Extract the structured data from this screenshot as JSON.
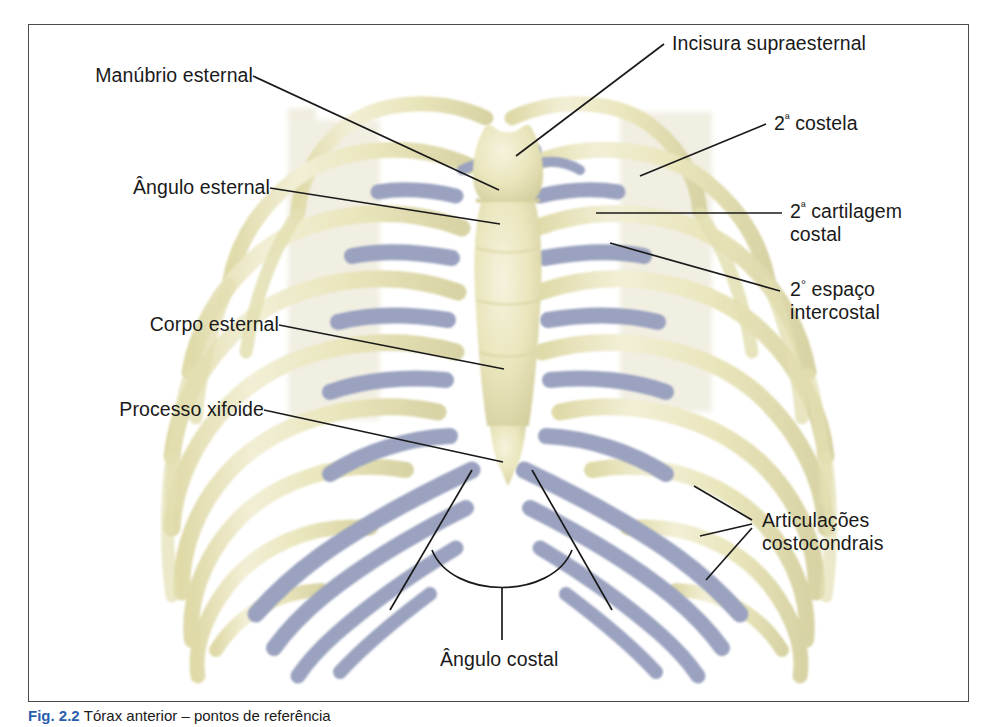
{
  "figure": {
    "caption_number": "Fig. 2.2",
    "caption_text": "Tórax anterior – pontos de referência",
    "frame_color": "#4a4a4a"
  },
  "palette": {
    "bone": "#e9e5bb",
    "bone_light": "#f2efd4",
    "bone_shadow": "#d6d2a2",
    "cartilage": "#9aa2bf",
    "cartilage_dark": "#8b94b4",
    "ghost": "#efecdd",
    "leader": "#1a1a1a",
    "caption_accent": "#2b5fad",
    "background": "#ffffff"
  },
  "labels": {
    "manubrio": "Manúbrio esternal",
    "angulo_esternal": "Ângulo esternal",
    "corpo_esternal": "Corpo esternal",
    "processo_xifoide": "Processo xifoide",
    "incisura": "Incisura supraesternal",
    "segunda_costela_pre": "2",
    "segunda_costela_ord": "ª",
    "segunda_costela_post": " costela",
    "cartilagem_pre": "2",
    "cartilagem_ord": "ª",
    "cartilagem_l1": " cartilagem",
    "cartilagem_l2": "costal",
    "espaco_pre": "2",
    "espaco_ord": "°",
    "espaco_l1": " espaço",
    "espaco_l2": "intercostal",
    "articulacoes_l1": "Articulações",
    "articulacoes_l2": "costocondrais",
    "angulo_costal": "Ângulo costal"
  }
}
